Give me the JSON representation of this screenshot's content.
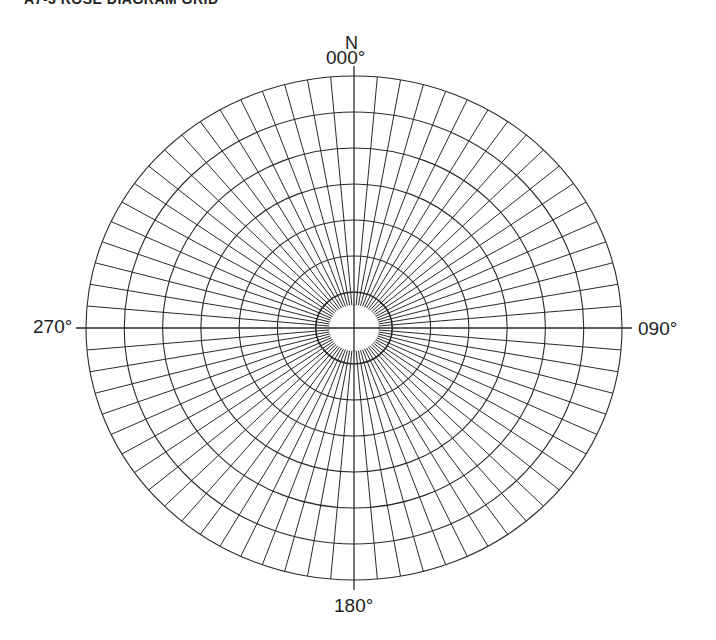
{
  "title": "A7-3 ROSE DIAGRAM GRID",
  "labels": {
    "north": "N",
    "bearing_000": "000°",
    "bearing_090": "090°",
    "bearing_180": "180°",
    "bearing_270": "270°"
  },
  "grid": {
    "center": [
      354,
      328
    ],
    "radius_x": 268,
    "radius_y": 252,
    "inner_radius_x": 25,
    "inner_radius_y": 23,
    "ring_count": 7,
    "spoke_interval_deg": 5,
    "line_color": "#2a2a2a",
    "background": "#ffffff"
  }
}
